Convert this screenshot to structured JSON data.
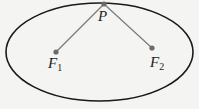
{
  "diagram": {
    "type": "ellipse-foci",
    "colors": {
      "background": "#f4f4f3",
      "ellipse_stroke": "#1a1a1a",
      "segment_stroke": "#7a7a7a",
      "point_fill": "#6b6b6b",
      "label_text": "#1e1e1e"
    },
    "ellipse": {
      "cx": 99.5,
      "cy": 52,
      "rx": 93.5,
      "ry": 49
    },
    "points": {
      "P": {
        "x": 104,
        "y": 4,
        "label": "P"
      },
      "F1": {
        "x": 56,
        "y": 52,
        "label": "F",
        "subscript": "1"
      },
      "F2": {
        "x": 152,
        "y": 48,
        "label": "F",
        "subscript": "2"
      }
    },
    "segments": [
      {
        "from": "P",
        "to": "F1"
      },
      {
        "from": "P",
        "to": "F2"
      }
    ]
  }
}
